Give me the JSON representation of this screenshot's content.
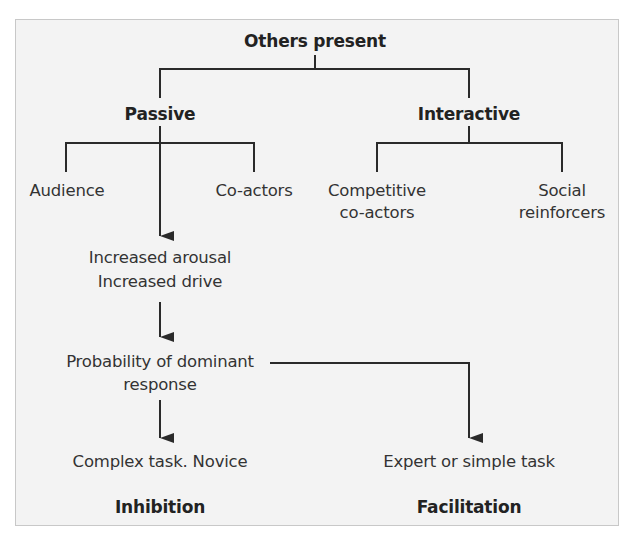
{
  "diagram": {
    "root": "Others present",
    "branches": [
      {
        "label": "Passive",
        "children": [
          "Audience",
          "Co-actors"
        ]
      },
      {
        "label": "Interactive",
        "children": [
          "Competitive co-actors",
          "Social reinforcers"
        ]
      }
    ],
    "flow": {
      "step1_line1": "Increased arousal",
      "step1_line2": "Increased drive",
      "step2_line1": "Probability of dominant",
      "step2_line2": "response"
    },
    "outcomes": {
      "left": {
        "condition": "Complex task. Novice",
        "result": "Inhibition"
      },
      "right": {
        "condition": "Expert or simple task",
        "result": "Facilitation"
      }
    }
  },
  "labels": {
    "root": "Others present",
    "passive": "Passive",
    "interactive": "Interactive",
    "audience": "Audience",
    "coactors": "Co-actors",
    "competitive_line1": "Competitive",
    "competitive_line2": "co-actors",
    "social_line1": "Social",
    "social_line2": "reinforcers",
    "arousal": "Increased arousal",
    "drive": "Increased drive",
    "probability_line1": "Probability of dominant",
    "probability_line2": "response",
    "complex": "Complex task. Novice",
    "expert": "Expert or simple task",
    "inhibition": "Inhibition",
    "facilitation": "Facilitation"
  },
  "colors": {
    "background": "#f3f3f3",
    "border": "#c8c8c8",
    "line": "#2a2a2a",
    "text": "#333333"
  }
}
